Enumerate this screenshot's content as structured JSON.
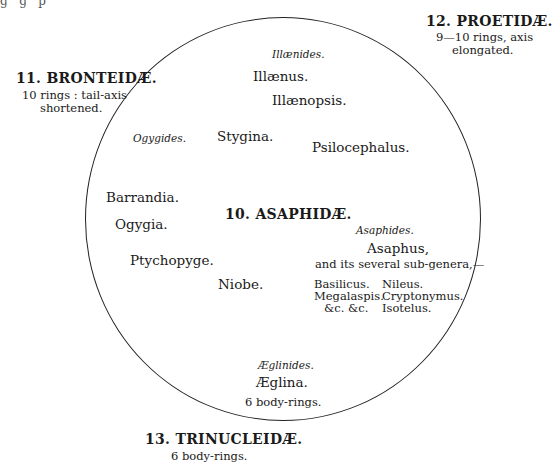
{
  "diagram": {
    "central_family": {
      "number_label": "10. ASAPHIDÆ.",
      "groups": [
        {
          "name": "Illænides.",
          "genera": [
            "Illænus.",
            "Illænopsis."
          ]
        },
        {
          "name": "Ogygides.",
          "genera": [
            "Stygina.",
            "Psilocephalus.",
            "Barrandia.",
            "Ogygia.",
            "Ptychopyge.",
            "Niobe."
          ]
        },
        {
          "name": "Asaphides.",
          "genera": [
            "Asaphus,"
          ],
          "note": "and its several sub-genera,—",
          "subgenera_col1": [
            "Basilicus.",
            "Megalaspis.",
            "&c.  &c."
          ],
          "subgenera_col2": [
            "Nileus.",
            "Cryptonymus.",
            "Isotelus."
          ]
        },
        {
          "name": "Æglinides.",
          "genera": [
            "Æglina."
          ],
          "note": "6 body-rings."
        }
      ]
    },
    "outer_families": [
      {
        "label": "11. BRONTEIDÆ.",
        "desc_line1": "10 rings :  tail-axis",
        "desc_line2": "shortened."
      },
      {
        "label": "12. PROETIDÆ.",
        "desc_line1": "9—10 rings, axis",
        "desc_line2": "elongated."
      },
      {
        "label": "13. TRINUCLEIDÆ.",
        "desc_line1": "6 body-rings."
      }
    ]
  }
}
